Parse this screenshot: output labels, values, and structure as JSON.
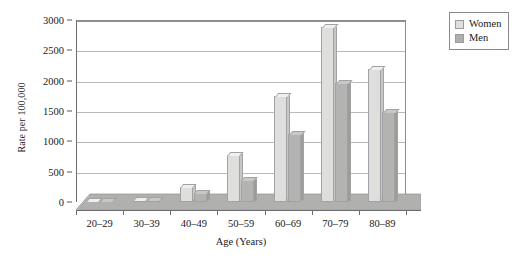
{
  "chart_data": {
    "type": "bar",
    "title": "",
    "xlabel": "Age (Years)",
    "ylabel": "Rate per 100,000",
    "categories": [
      "20–29",
      "30–39",
      "40–49",
      "50–59",
      "60–69",
      "70–79",
      "80–89"
    ],
    "series": [
      {
        "name": "Women",
        "color": "#dededc",
        "values": [
          15,
          40,
          250,
          770,
          1750,
          2880,
          2200
        ]
      },
      {
        "name": "Men",
        "color": "#b3b3b1",
        "values": [
          10,
          25,
          150,
          360,
          1120,
          1970,
          1480
        ]
      }
    ],
    "ylim": [
      0,
      3000
    ],
    "yticks": [
      0,
      500,
      1000,
      1500,
      2000,
      2500,
      3000
    ],
    "ytick_labels": [
      "0",
      "500",
      "1000",
      "1500",
      "2000",
      "2500",
      "3000"
    ],
    "grid": true,
    "legend_position": "top-right"
  },
  "legend": {
    "items": [
      {
        "label": "Women",
        "swatch": "women-swatch-icon"
      },
      {
        "label": "Men",
        "swatch": "men-swatch-icon"
      }
    ]
  }
}
